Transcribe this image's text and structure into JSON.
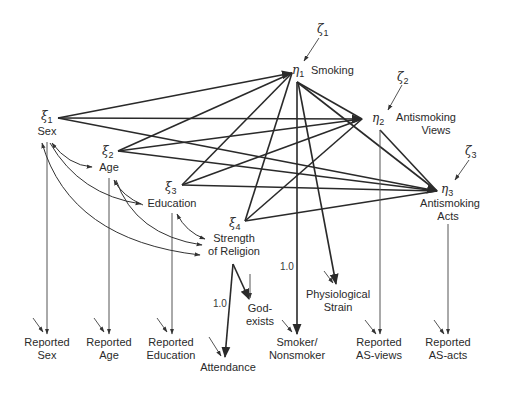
{
  "diagram": {
    "type": "structural-equation-path-diagram",
    "exogenous_latents": [
      {
        "symbol": "ξ",
        "index": "1",
        "label": "Sex"
      },
      {
        "symbol": "ξ",
        "index": "2",
        "label": "Age"
      },
      {
        "symbol": "ξ",
        "index": "3",
        "label": "Education"
      },
      {
        "symbol": "ξ",
        "index": "4",
        "label_line1": "Strength",
        "label_line2": "of Religion"
      }
    ],
    "endogenous_latents": [
      {
        "symbol": "η",
        "index": "1",
        "label": "Smoking"
      },
      {
        "symbol": "η",
        "index": "2",
        "label_line1": "Antismoking",
        "label_line2": "Views"
      },
      {
        "symbol": "η",
        "index": "3",
        "label_line1": "Antismoking",
        "label_line2": "Acts"
      }
    ],
    "disturbances": [
      {
        "symbol": "ζ",
        "index": "1",
        "target": "η1"
      },
      {
        "symbol": "ζ",
        "index": "2",
        "target": "η2"
      },
      {
        "symbol": "ζ",
        "index": "3",
        "target": "η3"
      }
    ],
    "indicators": {
      "reported_sex": {
        "line1": "Reported",
        "line2": "Sex"
      },
      "reported_age": {
        "line1": "Reported",
        "line2": "Age"
      },
      "reported_education": {
        "line1": "Reported",
        "line2": "Education"
      },
      "attendance": {
        "line1": "Attendance"
      },
      "god_exists": {
        "line1": "God-",
        "line2": "exists"
      },
      "smoker_nonsmoker": {
        "line1": "Smoker/",
        "line2": "Nonsmoker"
      },
      "physiological_strain": {
        "line1": "Physiological",
        "line2": "Strain"
      },
      "reported_as_views": {
        "line1": "Reported",
        "line2": "AS-views"
      },
      "reported_as_acts": {
        "line1": "Reported",
        "line2": "AS-acts"
      }
    },
    "coefficients": {
      "attendance_loading": "1.0",
      "smoker_loading": "1.0"
    },
    "paths": [
      {
        "from": "ξ1",
        "to": "η1"
      },
      {
        "from": "ξ1",
        "to": "η2"
      },
      {
        "from": "ξ1",
        "to": "η3"
      },
      {
        "from": "ξ2",
        "to": "η1"
      },
      {
        "from": "ξ2",
        "to": "η2"
      },
      {
        "from": "ξ2",
        "to": "η3"
      },
      {
        "from": "ξ3",
        "to": "η1"
      },
      {
        "from": "ξ3",
        "to": "η2"
      },
      {
        "from": "ξ3",
        "to": "η3"
      },
      {
        "from": "ξ4",
        "to": "η1"
      },
      {
        "from": "ξ4",
        "to": "η2"
      },
      {
        "from": "ξ4",
        "to": "η3"
      },
      {
        "from": "η1",
        "to": "η2"
      },
      {
        "from": "η1",
        "to": "η3"
      },
      {
        "from": "η2",
        "to": "η3"
      },
      {
        "from": "η1",
        "to": "Smoker/Nonsmoker",
        "coef": "1.0"
      },
      {
        "from": "η1",
        "to": "Physiological Strain"
      },
      {
        "from": "η2",
        "to": "Reported AS-views"
      },
      {
        "from": "η3",
        "to": "Reported AS-acts"
      },
      {
        "from": "ξ1",
        "to": "Reported Sex"
      },
      {
        "from": "ξ2",
        "to": "Reported Age"
      },
      {
        "from": "ξ3",
        "to": "Reported Education"
      },
      {
        "from": "ξ4",
        "to": "Attendance",
        "coef": "1.0"
      },
      {
        "from": "ξ4",
        "to": "God-exists"
      }
    ],
    "correlations": [
      {
        "between": [
          "ξ1",
          "ξ2"
        ]
      },
      {
        "between": [
          "ξ1",
          "ξ3"
        ]
      },
      {
        "between": [
          "ξ1",
          "ξ4"
        ]
      },
      {
        "between": [
          "ξ2",
          "ξ3"
        ]
      },
      {
        "between": [
          "ξ2",
          "ξ4"
        ]
      },
      {
        "between": [
          "ξ3",
          "ξ4"
        ]
      }
    ],
    "colors": {
      "line": "#2a2a2a",
      "thin_line": "#555555",
      "background": "#ffffff"
    }
  }
}
